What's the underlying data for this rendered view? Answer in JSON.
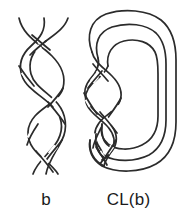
{
  "figure": {
    "background_color": "#ffffff",
    "stroke_color": "#2b2b2b",
    "width": 185,
    "height": 220
  },
  "panels": [
    {
      "id": "braid",
      "caption": "b",
      "description": "three-strand braid diagram",
      "strand_count": 3,
      "crossing_count": 8
    },
    {
      "id": "closure",
      "caption": "CL(b)",
      "description": "closure of the braid b with nested joining arcs",
      "strand_count": 3,
      "crossing_count": 8,
      "closure_arcs": 3
    }
  ],
  "labels": {
    "braid": "b",
    "closure": "CL(b)"
  }
}
